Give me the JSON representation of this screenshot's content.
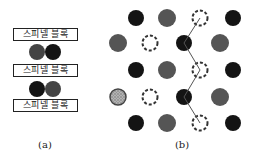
{
  "panel_a": {
    "label": "(a)",
    "blocks": [
      {
        "text": "스피넬 블록",
        "top": 28
      },
      {
        "text": "스피넬 블록",
        "top": 64
      },
      {
        "text": "스피넬 블록",
        "top": 99
      }
    ],
    "ion_pairs": [
      {
        "y": 52,
        "ions": [
          {
            "x": 37,
            "type": "gray"
          },
          {
            "x": 53,
            "type": "black"
          }
        ]
      },
      {
        "y": 89,
        "ions": [
          {
            "x": 37,
            "type": "black"
          },
          {
            "x": 53,
            "type": "gray"
          }
        ]
      }
    ]
  },
  "panel_b": {
    "label": "(b)",
    "legend_types": {
      "black": "solid near-black ion",
      "gray": "solid gray ion",
      "vacancy": "dashed-outline vacancy",
      "speckled": "speckled (dotted-fill) ion"
    },
    "rows": [
      {
        "y": 18,
        "sites": [
          {
            "x": 136,
            "type": "black"
          },
          {
            "x": 167,
            "type": "gray"
          },
          {
            "x": 200,
            "type": "vacancy"
          },
          {
            "x": 233,
            "type": "black"
          }
        ]
      },
      {
        "y": 43,
        "sites": [
          {
            "x": 118,
            "type": "gray"
          },
          {
            "x": 150,
            "type": "vacancy"
          },
          {
            "x": 184,
            "type": "black"
          },
          {
            "x": 220,
            "type": "gray"
          }
        ]
      },
      {
        "y": 70,
        "sites": [
          {
            "x": 136,
            "type": "black"
          },
          {
            "x": 167,
            "type": "gray"
          },
          {
            "x": 200,
            "type": "vacancy"
          },
          {
            "x": 233,
            "type": "black"
          }
        ]
      },
      {
        "y": 97,
        "sites": [
          {
            "x": 118,
            "type": "speckled"
          },
          {
            "x": 150,
            "type": "vacancy"
          },
          {
            "x": 184,
            "type": "black"
          },
          {
            "x": 220,
            "type": "gray"
          }
        ]
      },
      {
        "y": 123,
        "sites": [
          {
            "x": 136,
            "type": "black"
          },
          {
            "x": 167,
            "type": "gray"
          },
          {
            "x": 200,
            "type": "vacancy"
          },
          {
            "x": 233,
            "type": "black"
          }
        ]
      }
    ],
    "conduction_path": [
      [
        200,
        18
      ],
      [
        184,
        43
      ],
      [
        200,
        70
      ],
      [
        184,
        97
      ],
      [
        200,
        123
      ]
    ]
  },
  "colors": {
    "black": "#141414",
    "gray": "#555555",
    "vacancy_stroke": "#333333",
    "speckled_fill": "#9a9a9a",
    "line": "#555555",
    "block_border": "#222222"
  }
}
